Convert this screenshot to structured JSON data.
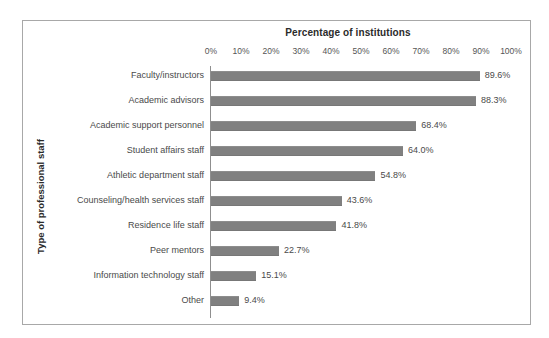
{
  "chart_data": {
    "type": "bar",
    "orientation": "horizontal",
    "title": "Percentage of institutions",
    "xlabel": "Percentage of institutions",
    "ylabel": "Type of professional staff",
    "xlim": [
      0,
      100
    ],
    "xticks": [
      "0%",
      "10%",
      "20%",
      "30%",
      "40%",
      "50%",
      "60%",
      "70%",
      "80%",
      "90%",
      "100%"
    ],
    "xtick_values": [
      0,
      10,
      20,
      30,
      40,
      50,
      60,
      70,
      80,
      90,
      100
    ],
    "grid": false,
    "legend": false,
    "bar_color": "#808080",
    "categories": [
      "Faculty/instructors",
      "Academic advisors",
      "Academic support personnel",
      "Student affairs staff",
      "Athletic department staff",
      "Counseling/health services staff",
      "Residence life staff",
      "Peer mentors",
      "Information technology staff",
      "Other"
    ],
    "values": [
      89.6,
      88.3,
      68.4,
      64.0,
      54.8,
      43.6,
      41.8,
      22.7,
      15.1,
      9.4
    ],
    "data_labels": [
      "89.6%",
      "88.3%",
      "68.4%",
      "64.0%",
      "54.8%",
      "43.6%",
      "41.8%",
      "22.7%",
      "15.1%",
      "9.4%"
    ]
  }
}
